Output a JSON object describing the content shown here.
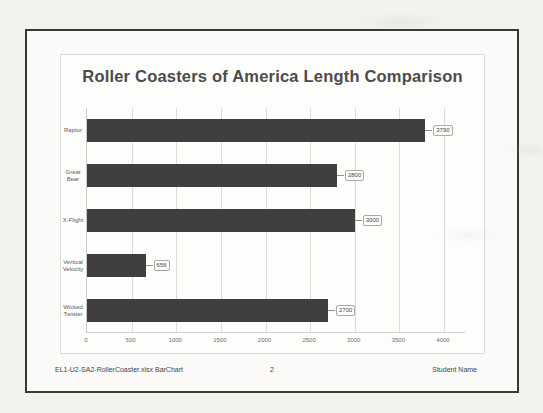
{
  "document": {
    "footer": {
      "left": "EL1-U2-SA2-RollerCoaster.xlsx BarChart",
      "center": "2",
      "right": "Student Name"
    }
  },
  "chart_data": {
    "type": "bar",
    "orientation": "horizontal",
    "title": "Roller Coasters of America Length Comparison",
    "categories": [
      "Raptor",
      "Great Bear",
      "X-Flight",
      "Vertical Velocity",
      "Wicked Twister"
    ],
    "values": [
      3790,
      2800,
      3000,
      656,
      2700
    ],
    "data_labels": [
      "3790",
      "2800",
      "3000",
      "656",
      "2700"
    ],
    "xlim": [
      0,
      4000
    ],
    "x_ticks": [
      0,
      500,
      1000,
      1500,
      2000,
      2500,
      3000,
      3500,
      4000
    ],
    "xlabel": "",
    "ylabel": "",
    "grid": true,
    "legend": false,
    "bar_color": "#403e3e",
    "gridline_color": "#dbdbd8"
  }
}
